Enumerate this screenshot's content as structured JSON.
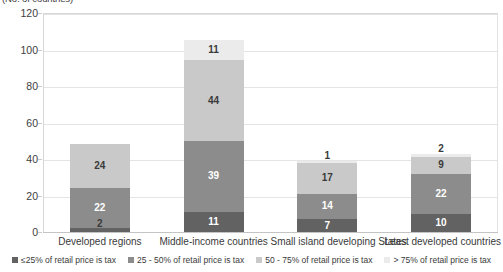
{
  "chart_data": {
    "type": "bar",
    "subtype": "stacked-bar",
    "title": "(No. of countries)",
    "xlabel": "",
    "ylabel": "",
    "ylim": [
      0,
      120
    ],
    "yticks": [
      0,
      20,
      40,
      60,
      80,
      100,
      120
    ],
    "ytick_labels": [
      "0",
      "20",
      "40",
      "60",
      "80",
      "100",
      "120"
    ],
    "grid": true,
    "legend_position": "bottom",
    "categories": [
      "Developed regions",
      "Middle-income countries",
      "Small island developing States",
      "Least developed countries"
    ],
    "series": [
      {
        "name": "≤25% of retail price is tax",
        "color": "#626262",
        "label_color": "#ffffff",
        "values": [
          2,
          11,
          7,
          10
        ]
      },
      {
        "name": "25 - 50%  of retail price is tax",
        "color": "#8c8c8c",
        "label_color": "#ffffff",
        "values": [
          22,
          39,
          14,
          22
        ]
      },
      {
        "name": "50 - 75%  of retail price is tax",
        "color": "#c9c9c9",
        "label_color": "#3a3a3a",
        "values": [
          24,
          44,
          17,
          9
        ]
      },
      {
        "name": "> 75%  of retail price is tax",
        "color": "#ebebeb",
        "label_color": "#3a3a3a",
        "values": [
          0,
          11,
          1,
          2
        ]
      }
    ],
    "totals": [
      48,
      105,
      39,
      43
    ]
  },
  "colors": {
    "background": "#ffffff",
    "gridline": "#e4e4e4",
    "axis": "#c4c4c4",
    "text": "#3a3a3a"
  }
}
